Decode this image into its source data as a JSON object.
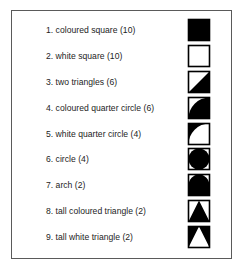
{
  "panel": {
    "title": "Shape legend",
    "border_color": "#5a5a5a",
    "background_color": "#ffffff",
    "ink_color": "#000000"
  },
  "legend": {
    "items": [
      {
        "index": "1",
        "label": "1. coloured square (10)",
        "name": "coloured square",
        "count": "10",
        "icon": "filled-square-icon"
      },
      {
        "index": "2",
        "label": "2. white square (10)",
        "name": "white square",
        "count": "10",
        "icon": "white-square-icon"
      },
      {
        "index": "3",
        "label": "3. two triangles (6)",
        "name": "two triangles",
        "count": "6",
        "icon": "two-triangles-icon"
      },
      {
        "index": "4",
        "label": "4. coloured quarter circle (6)",
        "name": "coloured quarter circle",
        "count": "6",
        "icon": "coloured-quarter-circle-icon"
      },
      {
        "index": "5",
        "label": "5. white quarter circle (4)",
        "name": "white quarter circle",
        "count": "4",
        "icon": "white-quarter-circle-icon"
      },
      {
        "index": "6",
        "label": "6. circle (4)",
        "name": "circle",
        "count": "4",
        "icon": "circle-icon"
      },
      {
        "index": "7",
        "label": "7. arch (2)",
        "name": "arch",
        "count": "2",
        "icon": "arch-icon"
      },
      {
        "index": "8",
        "label": "8. tall coloured triangle (2)",
        "name": "tall coloured triangle",
        "count": "2",
        "icon": "tall-coloured-triangle-icon"
      },
      {
        "index": "9",
        "label": "9. tall white triangle (2)",
        "name": "tall white triangle",
        "count": "2",
        "icon": "tall-white-triangle-icon"
      }
    ]
  }
}
